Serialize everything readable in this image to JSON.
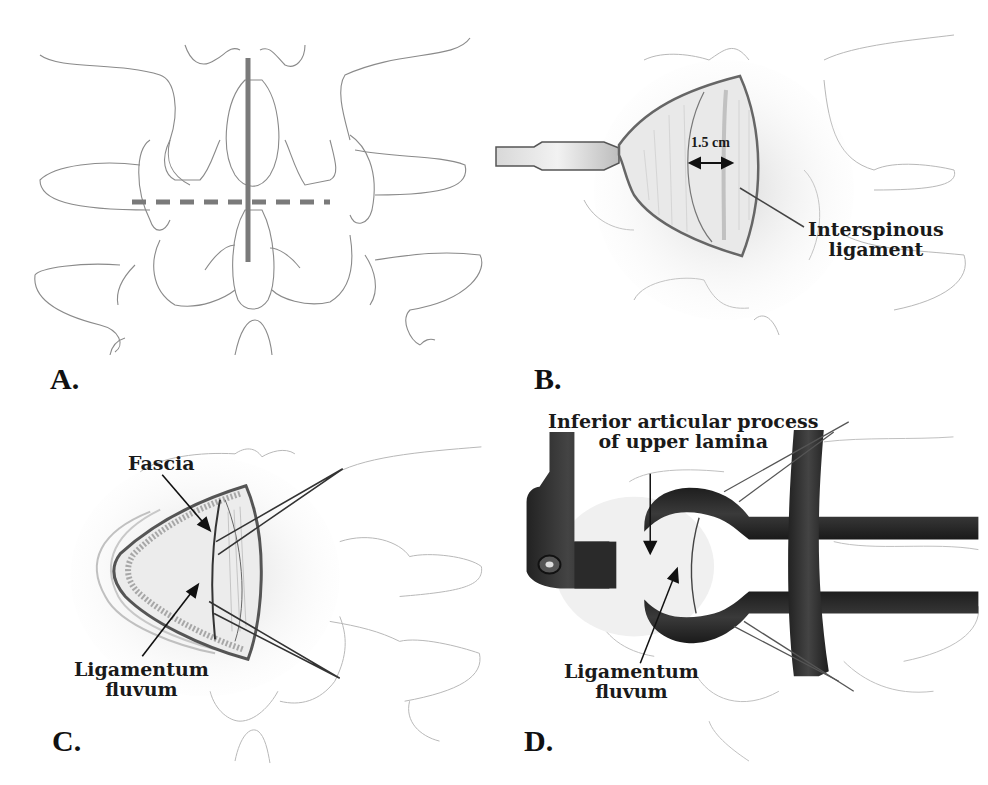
{
  "figure": {
    "panels": [
      {
        "id": "A",
        "letter": "A.",
        "description": "Posterior view of lumbar vertebrae with solid vertical midline incision line and dashed horizontal interlaminar line"
      },
      {
        "id": "B",
        "letter": "B.",
        "description": "Retractor exposing interspinous ligament through incision",
        "measurement_label": "1.5 cm",
        "callouts": [
          "Interspinous",
          "ligament"
        ]
      },
      {
        "id": "C",
        "letter": "C.",
        "description": "Fascia opened with forceps exposing ligamentum flavum",
        "callouts": {
          "fascia": "Fascia",
          "ligamentum_line1": "Ligamentum",
          "ligamentum_line2": "fluvum"
        }
      },
      {
        "id": "D",
        "letter": "D.",
        "description": "Tubular retractor with ring positioned over lamina",
        "callouts": {
          "inferior_line1": "Inferior articular process",
          "inferior_line2": "of upper lamina",
          "ligamentum_line1": "Ligamentum",
          "ligamentum_line2": "fluvum"
        }
      }
    ],
    "colors": {
      "line_art": "#9a9a9a",
      "incision_line": "#7d7d7d",
      "instrument": "#2b2b2b",
      "text": "#1a1a1a"
    }
  }
}
